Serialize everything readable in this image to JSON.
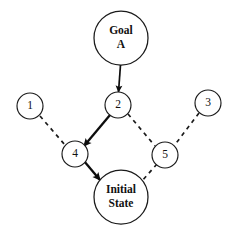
{
  "diagram": {
    "type": "directed-graph",
    "canvas": {
      "width": 239,
      "height": 235,
      "background": "#ffffff"
    },
    "colors": {
      "node_stroke": "#1a1a1a",
      "node_fill": "#ffffff",
      "solid_edge": "#0d0d0d",
      "dashed_edge": "#1a1a1a",
      "label_text": "#111111"
    },
    "nodes": [
      {
        "id": "goal-a",
        "label": "Goal\nA",
        "label_lines": [
          "Goal",
          "A"
        ],
        "shape": "circle",
        "size": "large",
        "cx": 121,
        "cy": 38,
        "r": 27
      },
      {
        "id": "node-2",
        "label": "2",
        "label_lines": [
          "2"
        ],
        "shape": "circle",
        "size": "small",
        "cx": 118,
        "cy": 105,
        "r": 13
      },
      {
        "id": "node-1",
        "label": "1",
        "label_lines": [
          "1"
        ],
        "shape": "circle",
        "size": "small",
        "cx": 30,
        "cy": 106,
        "r": 13
      },
      {
        "id": "node-3",
        "label": "3",
        "label_lines": [
          "3"
        ],
        "shape": "circle",
        "size": "small",
        "cx": 208,
        "cy": 103,
        "r": 13
      },
      {
        "id": "node-4",
        "label": "4",
        "label_lines": [
          "4"
        ],
        "shape": "circle",
        "size": "small",
        "cx": 75,
        "cy": 154,
        "r": 13
      },
      {
        "id": "node-5",
        "label": "5",
        "label_lines": [
          "5"
        ],
        "shape": "circle",
        "size": "small",
        "cx": 165,
        "cy": 155,
        "r": 13
      },
      {
        "id": "initial-state",
        "label": "Initial\nState",
        "label_lines": [
          "Initial",
          "State"
        ],
        "shape": "circle",
        "size": "large",
        "cx": 121,
        "cy": 197,
        "r": 27
      }
    ],
    "edges": [
      {
        "id": "edge-goal-a-to-2",
        "from": "goal-a",
        "to": "node-2",
        "style": "solid",
        "weight": "thin",
        "arrow": true,
        "x1": 120.5,
        "y1": 65,
        "x2": 118.5,
        "y2": 92
      },
      {
        "id": "edge-2-to-4",
        "from": "node-2",
        "to": "node-4",
        "style": "solid",
        "weight": "thick",
        "arrow": true,
        "x1": 110,
        "y1": 115,
        "x2": 84,
        "y2": 146
      },
      {
        "id": "edge-4-to-initial-state",
        "from": "node-4",
        "to": "initial-state",
        "style": "solid",
        "weight": "thick",
        "arrow": true,
        "x1": 84,
        "y1": 161,
        "x2": 100,
        "y2": 180
      },
      {
        "id": "edge-1-to-4",
        "from": "node-1",
        "to": "node-4",
        "style": "dashed",
        "weight": "thin",
        "arrow": false,
        "x1": 40,
        "y1": 116,
        "x2": 65,
        "y2": 145
      },
      {
        "id": "edge-2-to-5",
        "from": "node-2",
        "to": "node-5",
        "style": "dashed",
        "weight": "thin",
        "arrow": false,
        "x1": 128,
        "y1": 114,
        "x2": 155,
        "y2": 146
      },
      {
        "id": "edge-3-to-5",
        "from": "node-3",
        "to": "node-5",
        "style": "dashed",
        "weight": "thin",
        "arrow": false,
        "x1": 199,
        "y1": 113,
        "x2": 174,
        "y2": 146
      },
      {
        "id": "edge-5-to-initial-state",
        "from": "node-5",
        "to": "initial-state",
        "style": "dashed",
        "weight": "thin",
        "arrow": false,
        "x1": 157,
        "y1": 164,
        "x2": 142,
        "y2": 181
      }
    ]
  }
}
